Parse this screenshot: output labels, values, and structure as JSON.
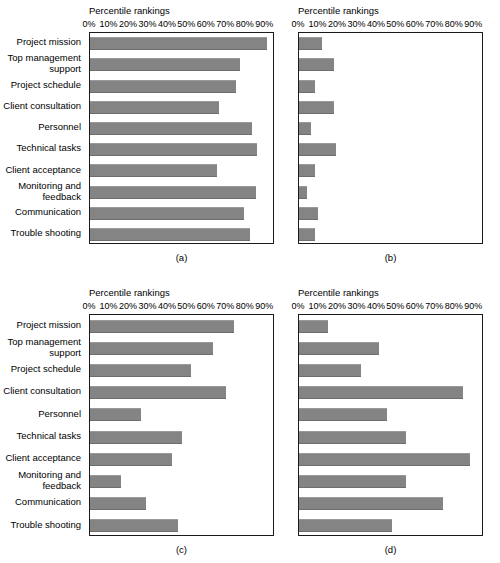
{
  "figure": {
    "axis_title": "Percentile rankings",
    "tick_labels": [
      "0%",
      "10%",
      "20%",
      "30%",
      "40%",
      "50%",
      "60%",
      "70%",
      "80%",
      "90%"
    ],
    "categories": [
      "Project mission",
      "Top management\nsupport",
      "Project schedule",
      "Client consultation",
      "Personnel",
      "Technical tasks",
      "Client acceptance",
      "Monitoring and\nfeedback",
      "Communication",
      "Trouble shooting"
    ],
    "bar_color": "#848484",
    "axis_color": "#1a1a1a",
    "background": "#ffffff"
  },
  "panels": {
    "a": {
      "caption": "(a)"
    },
    "b": {
      "caption": "(b)"
    },
    "c": {
      "caption": "(c)"
    },
    "d": {
      "caption": "(d)"
    }
  },
  "chart_data": [
    {
      "type": "bar",
      "orientation": "horizontal",
      "panel": "a",
      "title": "Percentile rankings",
      "xlabel": "Percentile rankings",
      "ylabel": "",
      "xlim": [
        0,
        95
      ],
      "grid": false,
      "legend": "none",
      "tick_labels": [
        "0%",
        "10%",
        "20%",
        "30%",
        "40%",
        "50%",
        "60%",
        "70%",
        "80%",
        "90%"
      ],
      "categories": [
        "Project mission",
        "Top management support",
        "Project schedule",
        "Client consultation",
        "Personnel",
        "Technical tasks",
        "Client acceptance",
        "Monitoring and feedback",
        "Communication",
        "Trouble shooting"
      ],
      "values": [
        91,
        77,
        75,
        66,
        83,
        86,
        65,
        85,
        79,
        82
      ]
    },
    {
      "type": "bar",
      "orientation": "horizontal",
      "panel": "b",
      "title": "Percentile rankings",
      "xlabel": "Percentile rankings",
      "ylabel": "",
      "xlim": [
        0,
        95
      ],
      "grid": false,
      "legend": "none",
      "tick_labels": [
        "0%",
        "10%",
        "20%",
        "30%",
        "40%",
        "50%",
        "60%",
        "70%",
        "80%",
        "90%"
      ],
      "categories": [
        "Project mission",
        "Top management support",
        "Project schedule",
        "Client consultation",
        "Personnel",
        "Technical tasks",
        "Client acceptance",
        "Monitoring and feedback",
        "Communication",
        "Trouble shooting"
      ],
      "values": [
        12,
        18,
        8,
        18,
        6,
        19,
        8,
        4,
        10,
        8
      ]
    },
    {
      "type": "bar",
      "orientation": "horizontal",
      "panel": "c",
      "title": "Percentile rankings",
      "xlabel": "Percentile rankings",
      "ylabel": "",
      "xlim": [
        0,
        95
      ],
      "grid": false,
      "legend": "none",
      "tick_labels": [
        "0%",
        "10%",
        "20%",
        "30%",
        "40%",
        "50%",
        "60%",
        "70%",
        "80%",
        "90%"
      ],
      "categories": [
        "Project mission",
        "Top management support",
        "Project schedule",
        "Client consultation",
        "Personnel",
        "Technical tasks",
        "Client acceptance",
        "Monitoring and feedback",
        "Communication",
        "Trouble shooting"
      ],
      "values": [
        74,
        63,
        52,
        70,
        26,
        47,
        42,
        16,
        29,
        45
      ]
    },
    {
      "type": "bar",
      "orientation": "horizontal",
      "panel": "d",
      "title": "Percentile rankings",
      "xlabel": "Percentile rankings",
      "ylabel": "",
      "xlim": [
        0,
        95
      ],
      "grid": false,
      "legend": "none",
      "tick_labels": [
        "0%",
        "10%",
        "20%",
        "30%",
        "40%",
        "50%",
        "60%",
        "70%",
        "80%",
        "90%"
      ],
      "categories": [
        "Project mission",
        "Top management support",
        "Project schedule",
        "Client consultation",
        "Personnel",
        "Technical tasks",
        "Client acceptance",
        "Monitoring and feedback",
        "Communication",
        "Trouble shooting"
      ],
      "values": [
        15,
        41,
        32,
        84,
        45,
        55,
        88,
        55,
        74,
        48
      ]
    }
  ]
}
